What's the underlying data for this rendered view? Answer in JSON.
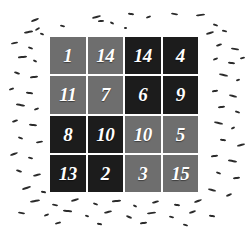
{
  "scene": {
    "background_color": "#ffffff",
    "speckle_color": "#2b2b2b"
  },
  "puzzle": {
    "rows": 4,
    "columns": 4,
    "tile_text_color": "#ffffff",
    "shades": {
      "dark": "#1c1c1c",
      "light": "#6e6e6e"
    },
    "tiles": [
      {
        "value": "1",
        "row": 1,
        "col": 1,
        "shade": "light"
      },
      {
        "value": "14",
        "row": 1,
        "col": 2,
        "shade": "light"
      },
      {
        "value": "14",
        "row": 1,
        "col": 3,
        "shade": "dark"
      },
      {
        "value": "4",
        "row": 1,
        "col": 4,
        "shade": "dark"
      },
      {
        "value": "11",
        "row": 2,
        "col": 1,
        "shade": "light"
      },
      {
        "value": "7",
        "row": 2,
        "col": 2,
        "shade": "light"
      },
      {
        "value": "6",
        "row": 2,
        "col": 3,
        "shade": "dark"
      },
      {
        "value": "9",
        "row": 2,
        "col": 4,
        "shade": "dark"
      },
      {
        "value": "8",
        "row": 3,
        "col": 1,
        "shade": "dark"
      },
      {
        "value": "10",
        "row": 3,
        "col": 2,
        "shade": "dark"
      },
      {
        "value": "10",
        "row": 3,
        "col": 3,
        "shade": "light"
      },
      {
        "value": "5",
        "row": 3,
        "col": 4,
        "shade": "light"
      },
      {
        "value": "13",
        "row": 4,
        "col": 1,
        "shade": "dark"
      },
      {
        "value": "2",
        "row": 4,
        "col": 2,
        "shade": "dark"
      },
      {
        "value": "3",
        "row": 4,
        "col": 3,
        "shade": "light"
      },
      {
        "value": "15",
        "row": 4,
        "col": 4,
        "shade": "light"
      }
    ]
  },
  "speckles": [
    {
      "x": 92,
      "y": 16,
      "w": 9,
      "h": 2,
      "r": -14
    },
    {
      "x": 128,
      "y": 13,
      "w": 6,
      "h": 2,
      "r": 8
    },
    {
      "x": 146,
      "y": 16,
      "w": 5,
      "h": 2,
      "r": -20
    },
    {
      "x": 171,
      "y": 13,
      "w": 7,
      "h": 2,
      "r": 10
    },
    {
      "x": 196,
      "y": 14,
      "w": 9,
      "h": 2,
      "r": -8
    },
    {
      "x": 31,
      "y": 19,
      "w": 8,
      "h": 2,
      "r": -22
    },
    {
      "x": 60,
      "y": 25,
      "w": 5,
      "h": 2,
      "r": 14
    },
    {
      "x": 110,
      "y": 22,
      "w": 4,
      "h": 2,
      "r": 30
    },
    {
      "x": 98,
      "y": 20,
      "w": 6,
      "h": 2,
      "r": -6
    },
    {
      "x": 213,
      "y": 24,
      "w": 5,
      "h": 2,
      "r": 18
    },
    {
      "x": 24,
      "y": 31,
      "w": 9,
      "h": 2,
      "r": -10
    },
    {
      "x": 40,
      "y": 33,
      "w": 4,
      "h": 2,
      "r": 22
    },
    {
      "x": 35,
      "y": 28,
      "w": 5,
      "h": 2,
      "r": -30
    },
    {
      "x": 124,
      "y": 27,
      "w": 3,
      "h": 2,
      "r": 0
    },
    {
      "x": 206,
      "y": 32,
      "w": 8,
      "h": 2,
      "r": -16
    },
    {
      "x": 222,
      "y": 30,
      "w": 5,
      "h": 2,
      "r": 12
    },
    {
      "x": 11,
      "y": 42,
      "w": 7,
      "h": 2,
      "r": -12
    },
    {
      "x": 28,
      "y": 47,
      "w": 5,
      "h": 2,
      "r": 20
    },
    {
      "x": 216,
      "y": 44,
      "w": 6,
      "h": 2,
      "r": -18
    },
    {
      "x": 231,
      "y": 48,
      "w": 8,
      "h": 2,
      "r": 10
    },
    {
      "x": 18,
      "y": 56,
      "w": 9,
      "h": 2,
      "r": -6
    },
    {
      "x": 33,
      "y": 60,
      "w": 4,
      "h": 2,
      "r": 26
    },
    {
      "x": 213,
      "y": 58,
      "w": 5,
      "h": 2,
      "r": -24
    },
    {
      "x": 228,
      "y": 62,
      "w": 7,
      "h": 2,
      "r": 6
    },
    {
      "x": 240,
      "y": 57,
      "w": 5,
      "h": 2,
      "r": -14
    },
    {
      "x": 14,
      "y": 72,
      "w": 6,
      "h": 2,
      "r": 16
    },
    {
      "x": 30,
      "y": 76,
      "w": 8,
      "h": 2,
      "r": -8
    },
    {
      "x": 219,
      "y": 74,
      "w": 9,
      "h": 2,
      "r": 12
    },
    {
      "x": 236,
      "y": 79,
      "w": 4,
      "h": 2,
      "r": -20
    },
    {
      "x": 9,
      "y": 88,
      "w": 5,
      "h": 2,
      "r": -18
    },
    {
      "x": 26,
      "y": 92,
      "w": 7,
      "h": 2,
      "r": 8
    },
    {
      "x": 212,
      "y": 90,
      "w": 6,
      "h": 2,
      "r": -10
    },
    {
      "x": 229,
      "y": 95,
      "w": 8,
      "h": 2,
      "r": 14
    },
    {
      "x": 16,
      "y": 104,
      "w": 9,
      "h": 2,
      "r": 10
    },
    {
      "x": 34,
      "y": 108,
      "w": 5,
      "h": 2,
      "r": -22
    },
    {
      "x": 218,
      "y": 106,
      "w": 7,
      "h": 2,
      "r": -6
    },
    {
      "x": 235,
      "y": 111,
      "w": 5,
      "h": 2,
      "r": 18
    },
    {
      "x": 12,
      "y": 120,
      "w": 6,
      "h": 2,
      "r": -16
    },
    {
      "x": 29,
      "y": 124,
      "w": 8,
      "h": 2,
      "r": 6
    },
    {
      "x": 214,
      "y": 122,
      "w": 9,
      "h": 2,
      "r": 12
    },
    {
      "x": 231,
      "y": 127,
      "w": 4,
      "h": 2,
      "r": -26
    },
    {
      "x": 18,
      "y": 137,
      "w": 5,
      "h": 2,
      "r": 20
    },
    {
      "x": 36,
      "y": 141,
      "w": 7,
      "h": 2,
      "r": -10
    },
    {
      "x": 220,
      "y": 139,
      "w": 6,
      "h": 2,
      "r": 8
    },
    {
      "x": 237,
      "y": 144,
      "w": 8,
      "h": 2,
      "r": -14
    },
    {
      "x": 10,
      "y": 153,
      "w": 8,
      "h": 2,
      "r": -20
    },
    {
      "x": 28,
      "y": 157,
      "w": 5,
      "h": 2,
      "r": 14
    },
    {
      "x": 211,
      "y": 155,
      "w": 7,
      "h": 2,
      "r": -8
    },
    {
      "x": 228,
      "y": 160,
      "w": 9,
      "h": 2,
      "r": 10
    },
    {
      "x": 16,
      "y": 170,
      "w": 6,
      "h": 2,
      "r": 16
    },
    {
      "x": 33,
      "y": 174,
      "w": 8,
      "h": 2,
      "r": -12
    },
    {
      "x": 216,
      "y": 172,
      "w": 5,
      "h": 2,
      "r": 22
    },
    {
      "x": 233,
      "y": 177,
      "w": 7,
      "h": 2,
      "r": -6
    },
    {
      "x": 22,
      "y": 187,
      "w": 9,
      "h": 2,
      "r": -18
    },
    {
      "x": 41,
      "y": 191,
      "w": 5,
      "h": 2,
      "r": 10
    },
    {
      "x": 208,
      "y": 189,
      "w": 8,
      "h": 2,
      "r": 14
    },
    {
      "x": 226,
      "y": 194,
      "w": 6,
      "h": 2,
      "r": -22
    },
    {
      "x": 30,
      "y": 200,
      "w": 10,
      "h": 2,
      "r": -10
    },
    {
      "x": 52,
      "y": 204,
      "w": 6,
      "h": 2,
      "r": 12
    },
    {
      "x": 71,
      "y": 199,
      "w": 8,
      "h": 2,
      "r": -16
    },
    {
      "x": 93,
      "y": 203,
      "w": 5,
      "h": 2,
      "r": 20
    },
    {
      "x": 112,
      "y": 200,
      "w": 9,
      "h": 2,
      "r": -6
    },
    {
      "x": 133,
      "y": 205,
      "w": 4,
      "h": 2,
      "r": 26
    },
    {
      "x": 152,
      "y": 201,
      "w": 7,
      "h": 2,
      "r": -14
    },
    {
      "x": 174,
      "y": 204,
      "w": 6,
      "h": 2,
      "r": 8
    },
    {
      "x": 194,
      "y": 200,
      "w": 8,
      "h": 2,
      "r": -20
    },
    {
      "x": 18,
      "y": 212,
      "w": 7,
      "h": 2,
      "r": 10
    },
    {
      "x": 44,
      "y": 214,
      "w": 5,
      "h": 2,
      "r": -24
    },
    {
      "x": 63,
      "y": 210,
      "w": 9,
      "h": 2,
      "r": 6
    },
    {
      "x": 85,
      "y": 215,
      "w": 4,
      "h": 2,
      "r": 18
    },
    {
      "x": 104,
      "y": 211,
      "w": 8,
      "h": 2,
      "r": -12
    },
    {
      "x": 126,
      "y": 216,
      "w": 6,
      "h": 2,
      "r": 22
    },
    {
      "x": 147,
      "y": 212,
      "w": 9,
      "h": 2,
      "r": -8
    },
    {
      "x": 169,
      "y": 216,
      "w": 5,
      "h": 2,
      "r": 14
    },
    {
      "x": 189,
      "y": 211,
      "w": 7,
      "h": 2,
      "r": -18
    },
    {
      "x": 209,
      "y": 215,
      "w": 6,
      "h": 2,
      "r": 9
    },
    {
      "x": 55,
      "y": 222,
      "w": 6,
      "h": 2,
      "r": -15
    },
    {
      "x": 97,
      "y": 223,
      "w": 5,
      "h": 2,
      "r": 11
    },
    {
      "x": 140,
      "y": 222,
      "w": 7,
      "h": 2,
      "r": -9
    },
    {
      "x": 183,
      "y": 224,
      "w": 5,
      "h": 2,
      "r": 17
    }
  ]
}
